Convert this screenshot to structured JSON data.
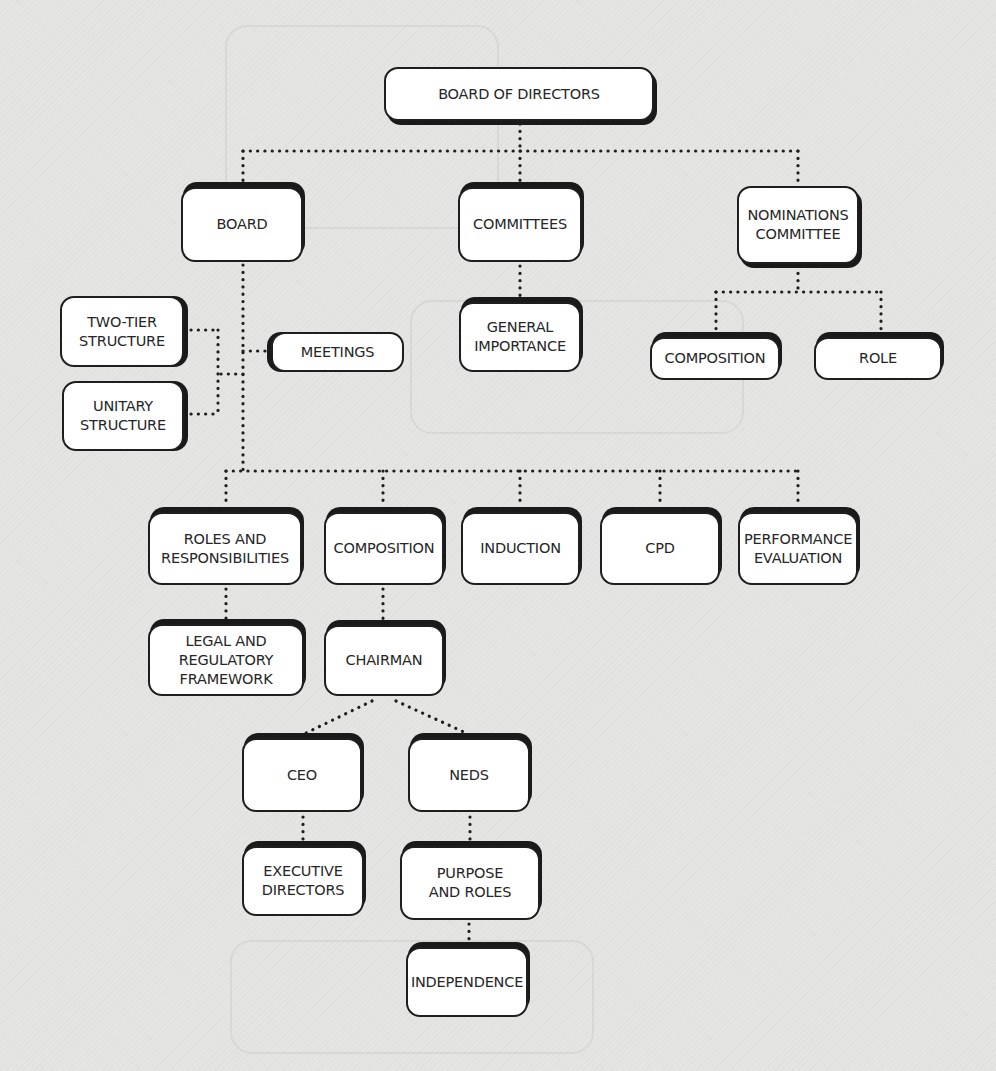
{
  "diagram": {
    "type": "hierarchy",
    "root": "BOARD OF DIRECTORS",
    "connector_style": "dotted",
    "colors": {
      "background": "#e4e4e2",
      "node_fill": "#ffffff",
      "node_border": "#1e1e1e",
      "connector": "#1e1e1e",
      "text": "#262626"
    },
    "nodes": {
      "board_of_directors": "BOARD OF DIRECTORS",
      "board": "BOARD",
      "committees": "COMMITTEES",
      "nominations_committee": "NOMINATIONS\nCOMMITTEE",
      "two_tier_structure": "TWO-TIER\nSTRUCTURE",
      "unitary_structure": "UNITARY\nSTRUCTURE",
      "meetings": "MEETINGS",
      "general_importance": "GENERAL\nIMPORTANCE",
      "nom_composition": "COMPOSITION",
      "nom_role": "ROLE",
      "roles_and_responsibilities": "ROLES AND\nRESPONSIBILITIES",
      "composition": "COMPOSITION",
      "induction": "INDUCTION",
      "cpd": "CPD",
      "performance_evaluation": "PERFORMANCE\nEVALUATION",
      "legal_and_regulatory_framework": "LEGAL AND\nREGULATORY\nFRAMEWORK",
      "chairman": "CHAIRMAN",
      "ceo": "CEO",
      "neds": "NEDS",
      "executive_directors": "EXECUTIVE\nDIRECTORS",
      "purpose_and_roles": "PURPOSE\nAND ROLES",
      "independence": "INDEPENDENCE"
    },
    "edges": [
      [
        "BOARD OF DIRECTORS",
        "BOARD"
      ],
      [
        "BOARD OF DIRECTORS",
        "COMMITTEES"
      ],
      [
        "BOARD OF DIRECTORS",
        "NOMINATIONS COMMITTEE"
      ],
      [
        "COMMITTEES",
        "GENERAL IMPORTANCE"
      ],
      [
        "NOMINATIONS COMMITTEE",
        "COMPOSITION"
      ],
      [
        "NOMINATIONS COMMITTEE",
        "ROLE"
      ],
      [
        "BOARD",
        "TWO-TIER STRUCTURE"
      ],
      [
        "BOARD",
        "UNITARY STRUCTURE"
      ],
      [
        "BOARD",
        "MEETINGS"
      ],
      [
        "BOARD",
        "ROLES AND RESPONSIBILITIES"
      ],
      [
        "BOARD",
        "COMPOSITION"
      ],
      [
        "BOARD",
        "INDUCTION"
      ],
      [
        "BOARD",
        "CPD"
      ],
      [
        "BOARD",
        "PERFORMANCE EVALUATION"
      ],
      [
        "ROLES AND RESPONSIBILITIES",
        "LEGAL AND REGULATORY FRAMEWORK"
      ],
      [
        "COMPOSITION",
        "CHAIRMAN"
      ],
      [
        "CHAIRMAN",
        "CEO"
      ],
      [
        "CHAIRMAN",
        "NEDS"
      ],
      [
        "CEO",
        "EXECUTIVE DIRECTORS"
      ],
      [
        "NEDS",
        "PURPOSE AND ROLES"
      ],
      [
        "PURPOSE AND ROLES",
        "INDEPENDENCE"
      ]
    ]
  }
}
